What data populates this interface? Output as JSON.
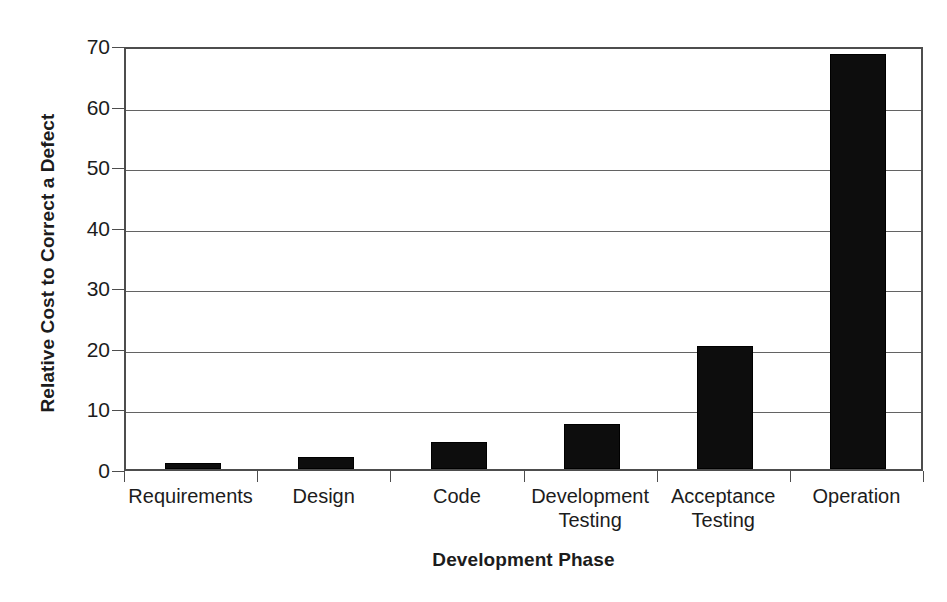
{
  "chart_data": {
    "type": "bar",
    "title": "",
    "xlabel": "Development Phase",
    "ylabel": "Relative Cost to Correct a Defect",
    "categories": [
      "Requirements",
      "Design",
      "Code",
      "Development Testing",
      "Acceptance Testing",
      "Operation"
    ],
    "category_lines": [
      [
        "Requirements"
      ],
      [
        "Design"
      ],
      [
        "Code"
      ],
      [
        "Development",
        "Testing"
      ],
      [
        "Acceptance",
        "Testing"
      ],
      [
        "Operation"
      ]
    ],
    "values": [
      1,
      2,
      4.5,
      7.5,
      20.3,
      68.5
    ],
    "ylim": [
      0,
      70
    ],
    "yticks": [
      0,
      10,
      20,
      30,
      40,
      50,
      60,
      70
    ],
    "ytick_labels": [
      "0",
      "10",
      "20",
      "30",
      "40",
      "50",
      "60",
      "70"
    ],
    "grid": true,
    "legend": false,
    "bar_color": "#0d0d0d",
    "background_color": "#ffffff",
    "axis_color": "#4d4d4d",
    "grid_color": "#636363",
    "text_color": "#1c1c1c"
  }
}
